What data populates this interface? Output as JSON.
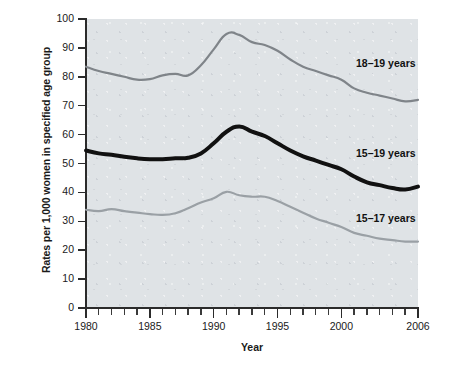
{
  "chart_data": {
    "type": "line",
    "title": "",
    "xlabel": "Year",
    "ylabel": "Rates per 1,000 women in specified age group",
    "xlim": [
      1980,
      2006
    ],
    "ylim": [
      0,
      100
    ],
    "ytick_labels": [
      "100",
      "90",
      "80",
      "70",
      "60",
      "50",
      "40",
      "30",
      "20",
      "10",
      "0"
    ],
    "ytick_values": [
      100,
      90,
      80,
      70,
      60,
      50,
      40,
      30,
      20,
      10,
      0
    ],
    "xtick_labels": [
      "1980",
      "1985",
      "1990",
      "1995",
      "2000",
      "2006"
    ],
    "xtick_values": [
      1980,
      1985,
      1990,
      1995,
      2000,
      2006
    ],
    "grid": false,
    "legend_position": "inline-right",
    "x": [
      1980,
      1981,
      1982,
      1983,
      1984,
      1985,
      1986,
      1987,
      1988,
      1989,
      1990,
      1991,
      1992,
      1993,
      1994,
      1995,
      1996,
      1997,
      1998,
      1999,
      2000,
      2001,
      2002,
      2003,
      2004,
      2005,
      2006
    ],
    "series": [
      {
        "name": "18–19 years",
        "color": "#7f8489",
        "width": 2.2,
        "values": [
          83.5,
          82.0,
          81.0,
          80.0,
          79.0,
          79.2,
          80.5,
          81.0,
          80.5,
          84.0,
          89.5,
          94.8,
          94.5,
          92.0,
          91.0,
          89.0,
          86.0,
          83.5,
          82.0,
          80.5,
          79.0,
          76.0,
          74.5,
          73.5,
          72.5,
          71.5,
          72.0
        ]
      },
      {
        "name": "15–19 years",
        "color": "#111111",
        "width": 4.0,
        "values": [
          54.5,
          53.5,
          53.0,
          52.3,
          51.8,
          51.5,
          51.5,
          51.8,
          52.0,
          53.5,
          57.0,
          61.0,
          62.8,
          61.0,
          59.5,
          57.0,
          54.5,
          52.5,
          51.0,
          49.5,
          48.0,
          45.5,
          43.5,
          42.5,
          41.5,
          41.0,
          42.0
        ]
      },
      {
        "name": "15–17 years",
        "color": "#9aa0a5",
        "width": 2.2,
        "values": [
          34.0,
          33.5,
          34.2,
          33.5,
          33.0,
          32.5,
          32.2,
          32.8,
          34.5,
          36.5,
          38.0,
          40.2,
          39.0,
          38.5,
          38.5,
          37.0,
          35.0,
          33.0,
          31.0,
          29.5,
          28.0,
          26.0,
          25.0,
          24.0,
          23.5,
          23.0,
          23.0
        ]
      }
    ]
  },
  "axes": {
    "y_title": "Rates per 1,000 women in specified age group",
    "x_title": "Year"
  },
  "labels": {
    "series_18_19": "18–19 years",
    "series_15_19": "15–19 years",
    "series_15_17": "15–17 years"
  },
  "colors": {
    "plot_background": "#dfe3e6",
    "axis": "#2b2b2b",
    "line_18_19": "#7f8489",
    "line_15_19": "#111111",
    "line_15_17": "#9aa0a5",
    "page_background": "#ffffff"
  }
}
